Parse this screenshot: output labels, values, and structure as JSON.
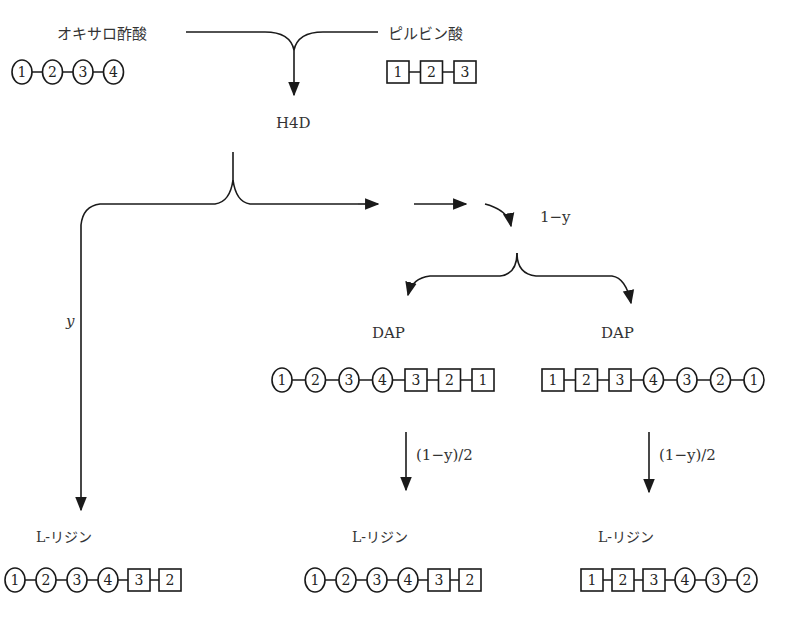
{
  "diagram": {
    "sources": {
      "oxaloacetate": {
        "label": "オキサロ酢酸",
        "chain": [
          {
            "shape": "circle",
            "n": "1"
          },
          {
            "shape": "circle",
            "n": "2"
          },
          {
            "shape": "circle",
            "n": "3"
          },
          {
            "shape": "circle",
            "n": "4"
          }
        ]
      },
      "pyruvate": {
        "label": "ピルビン酸",
        "chain": [
          {
            "shape": "square",
            "n": "1"
          },
          {
            "shape": "square",
            "n": "2"
          },
          {
            "shape": "square",
            "n": "3"
          }
        ]
      }
    },
    "intermediate": {
      "label": "H4D"
    },
    "branch_left": {
      "label": "y"
    },
    "branch_right": {
      "label": "1−y"
    },
    "dap_left": {
      "label": "DAP",
      "chain": [
        {
          "shape": "circle",
          "n": "1"
        },
        {
          "shape": "circle",
          "n": "2"
        },
        {
          "shape": "circle",
          "n": "3"
        },
        {
          "shape": "circle",
          "n": "4"
        },
        {
          "shape": "square",
          "n": "3"
        },
        {
          "shape": "square",
          "n": "2"
        },
        {
          "shape": "square",
          "n": "1"
        }
      ]
    },
    "dap_right": {
      "label": "DAP",
      "chain": [
        {
          "shape": "square",
          "n": "1"
        },
        {
          "shape": "square",
          "n": "2"
        },
        {
          "shape": "square",
          "n": "3"
        },
        {
          "shape": "circle",
          "n": "4"
        },
        {
          "shape": "circle",
          "n": "3"
        },
        {
          "shape": "circle",
          "n": "2"
        },
        {
          "shape": "circle",
          "n": "1"
        }
      ]
    },
    "flux_dap_left": {
      "label": "(1−y)/2"
    },
    "flux_dap_right": {
      "label": "(1−y)/2"
    },
    "lysine_1": {
      "label": "L-リジン",
      "chain": [
        {
          "shape": "circle",
          "n": "1"
        },
        {
          "shape": "circle",
          "n": "2"
        },
        {
          "shape": "circle",
          "n": "3"
        },
        {
          "shape": "circle",
          "n": "4"
        },
        {
          "shape": "square",
          "n": "3"
        },
        {
          "shape": "square",
          "n": "2"
        }
      ]
    },
    "lysine_2": {
      "label": "L-リジン",
      "chain": [
        {
          "shape": "circle",
          "n": "1"
        },
        {
          "shape": "circle",
          "n": "2"
        },
        {
          "shape": "circle",
          "n": "3"
        },
        {
          "shape": "circle",
          "n": "4"
        },
        {
          "shape": "square",
          "n": "3"
        },
        {
          "shape": "square",
          "n": "2"
        }
      ]
    },
    "lysine_3": {
      "label": "L-リジン",
      "chain": [
        {
          "shape": "square",
          "n": "1"
        },
        {
          "shape": "square",
          "n": "2"
        },
        {
          "shape": "square",
          "n": "3"
        },
        {
          "shape": "circle",
          "n": "4"
        },
        {
          "shape": "circle",
          "n": "3"
        },
        {
          "shape": "circle",
          "n": "2"
        }
      ]
    }
  },
  "colors": {
    "line": "#1a1a1a",
    "text": "#333333",
    "background": "#ffffff"
  }
}
